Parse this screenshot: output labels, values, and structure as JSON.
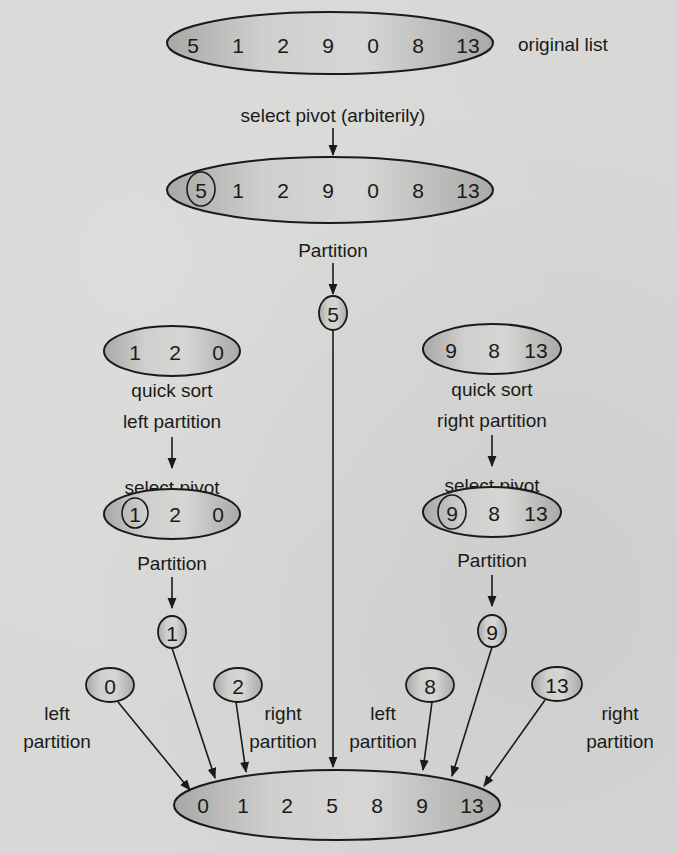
{
  "diagram": {
    "original": {
      "values": [
        "5",
        "1",
        "2",
        "9",
        "0",
        "8",
        "13"
      ],
      "label": "original list"
    },
    "step_select_pivot": "select pivot (arbiterily)",
    "pivot_list": {
      "values": [
        "5",
        "1",
        "2",
        "9",
        "0",
        "8",
        "13"
      ],
      "pivot": "5"
    },
    "step_partition": "Partition",
    "root_pivot": "5",
    "left": {
      "values": [
        "1",
        "2",
        "0"
      ],
      "caption_line1": "quick sort",
      "caption_line2": "left partition",
      "select_pivot": "select pivot",
      "pivot_values": [
        "1",
        "2",
        "0"
      ],
      "partition": "Partition",
      "pivot": "1",
      "left_child": "0",
      "right_child": "2",
      "left_label_1": "left",
      "left_label_2": "partition",
      "right_label_1": "right",
      "right_label_2": "partition"
    },
    "right": {
      "values": [
        "9",
        "8",
        "13"
      ],
      "caption_line1": "quick sort",
      "caption_line2": "right partition",
      "select_pivot": "select pivot",
      "pivot_values": [
        "9",
        "8",
        "13"
      ],
      "partition": "Partition",
      "pivot": "9",
      "left_child": "8",
      "right_child": "13",
      "left_label_1": "left",
      "left_label_2": "partition",
      "right_label_1": "right",
      "right_label_2": "partition"
    },
    "sorted": {
      "values": [
        "0",
        "1",
        "2",
        "5",
        "8",
        "9",
        "13"
      ]
    },
    "colors": {
      "background": "#d8d8d6",
      "oval_fill_light": "#d4d4d2",
      "oval_fill_dark": "#a9a9a7",
      "ink": "#1a1a1a"
    }
  }
}
